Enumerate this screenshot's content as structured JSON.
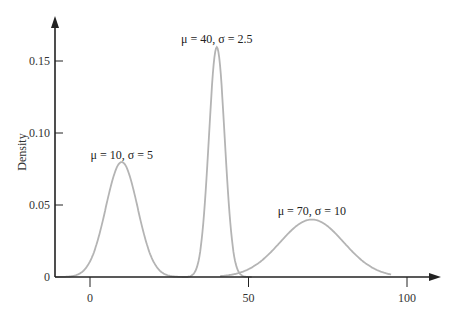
{
  "chart_data": {
    "type": "line",
    "title": "",
    "xlabel": "",
    "ylabel": "Density",
    "xlim": [
      -11,
      105
    ],
    "ylim": [
      0,
      0.175
    ],
    "grid": false,
    "legend": "none (inline annotations)",
    "x_ticks": [
      0,
      50,
      100
    ],
    "x_tick_labels": [
      "0",
      "50",
      "100"
    ],
    "y_ticks": [
      0,
      0.05,
      0.1,
      0.15
    ],
    "y_tick_labels": [
      "0",
      "0.05",
      "0.10",
      "0.15"
    ],
    "series": [
      {
        "name": "μ = 10, σ = 5",
        "distribution": "normal",
        "mu": 10,
        "sigma": 5,
        "x_range": [
          -11,
          31
        ],
        "peak_density": 0.0798
      },
      {
        "name": "μ = 40, σ = 2.5",
        "distribution": "normal",
        "mu": 40,
        "sigma": 2.5,
        "x_range": [
          29,
          51
        ],
        "peak_density": 0.1596
      },
      {
        "name": "μ = 70, σ = 10",
        "distribution": "normal",
        "mu": 70,
        "sigma": 10,
        "x_range": [
          41,
          95
        ],
        "peak_density": 0.0399
      }
    ],
    "annotations": [
      {
        "text": "μ = 10, σ = 5",
        "x": 10,
        "y": 0.085
      },
      {
        "text": "μ = 40, σ = 2.5",
        "x": 40,
        "y": 0.165
      },
      {
        "text": "μ = 70, σ = 10",
        "x": 70,
        "y": 0.046
      }
    ],
    "colors": {
      "curve": "#b4b4b4",
      "axis": "#222222"
    }
  }
}
